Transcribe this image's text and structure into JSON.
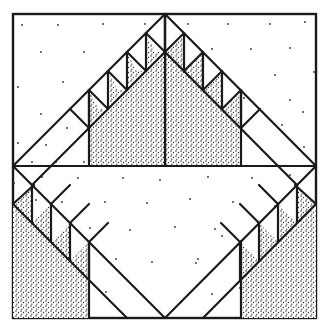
{
  "diagram": {
    "type": "quilt-block",
    "colors": {
      "line": "#1a1a1a",
      "background": "#ffffff",
      "stipple": "#2a2a2a"
    },
    "frame": {
      "left": 13,
      "top": 14,
      "right": 316,
      "bottom": 318,
      "mid_y": 166,
      "center_x": 165
    },
    "band_width": 38,
    "teeth_per_band": 4,
    "regions": [
      {
        "name": "top-center-triangle",
        "fill": "stippled"
      },
      {
        "name": "lower-left-corner",
        "fill": "stippled"
      },
      {
        "name": "lower-right-corner",
        "fill": "stippled"
      },
      {
        "name": "sawtooth-bands",
        "fill": "alternating stippled/white triangles"
      },
      {
        "name": "background",
        "fill": "white with sparse dots"
      }
    ]
  }
}
